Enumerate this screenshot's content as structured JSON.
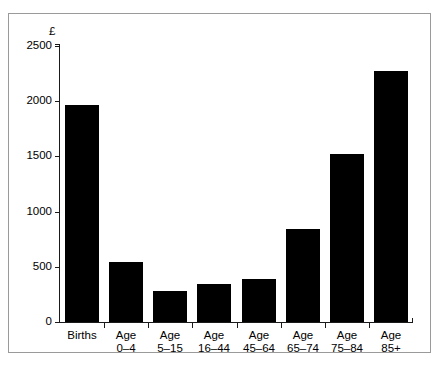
{
  "figure": {
    "unit_label": "£",
    "frame": true
  },
  "chart_data": {
    "type": "bar",
    "title": "",
    "subtitle": "",
    "xlabel": "",
    "ylabel": "£",
    "ylim": [
      0,
      2500
    ],
    "yticks": [
      0,
      500,
      1000,
      1500,
      2000,
      2500
    ],
    "ytick_labels": [
      "0",
      "500",
      "1000",
      "1500",
      "2000",
      "2500"
    ],
    "grid": false,
    "legend": "none",
    "bar_color": "#000000",
    "axis_color": "#1a1a1a",
    "categories": [
      "Births",
      "Age 0–4",
      "Age 5–15",
      "Age 16–44",
      "Age 45–64",
      "Age 65–74",
      "Age 75–84",
      "Age 85+"
    ],
    "category_lines": [
      [
        "Births",
        ""
      ],
      [
        "Age",
        "0–4"
      ],
      [
        "Age",
        "5–15"
      ],
      [
        "Age",
        "16–44"
      ],
      [
        "Age",
        "45–64"
      ],
      [
        "Age",
        "65–74"
      ],
      [
        "Age",
        "75–84"
      ],
      [
        "Age",
        "85+"
      ]
    ],
    "values": [
      1970,
      540,
      280,
      340,
      390,
      840,
      1520,
      2270
    ]
  }
}
